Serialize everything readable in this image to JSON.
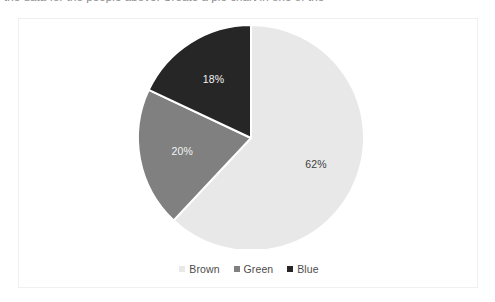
{
  "page": {
    "cutoff_header_text": "the data for the people above. Create a pie chart in one of the",
    "background_color": "#ffffff"
  },
  "chart_frame": {
    "border_color": "#f0f0f1",
    "background_color": "#ffffff"
  },
  "chart_data": {
    "type": "pie",
    "title": "",
    "categories": [
      "Brown",
      "Green",
      "Blue"
    ],
    "values": [
      62,
      20,
      18
    ],
    "value_unit": "%",
    "data_labels": [
      "62%",
      "20%",
      "18%"
    ],
    "colors": [
      "#e8e8e8",
      "#808080",
      "#262626"
    ],
    "label_text_colors": [
      "#3f3f3f",
      "#f2f2f2",
      "#f2f2f2"
    ],
    "start_angle_deg": 0,
    "direction": "clockwise",
    "slice_separator_color": "#ffffff",
    "legend": {
      "position": "bottom",
      "entries": [
        {
          "label": "Brown",
          "color": "#e8e8e8"
        },
        {
          "label": "Green",
          "color": "#808080"
        },
        {
          "label": "Blue",
          "color": "#262626"
        }
      ]
    },
    "geometry": {
      "center_x": 232,
      "center_y": 119,
      "radius": 113
    }
  }
}
